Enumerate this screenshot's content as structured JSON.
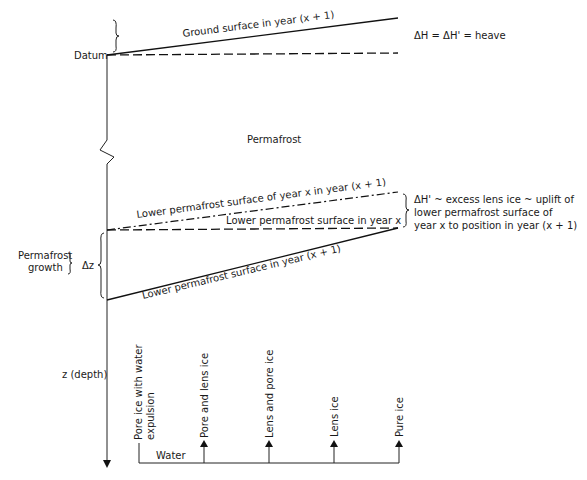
{
  "diagram": {
    "datum_label": "Datum",
    "ground_surface_label": "Ground surface in year (x + 1)",
    "heave_label": "ΔH = ΔH' = heave",
    "permafrost_label": "Permafrost",
    "lower_pf_x_in_x1_label": "Lower permafrost surface of year x in year (x + 1)",
    "lower_pf_x_label": "Lower permafrost surface in year x",
    "lower_pf_x1_label": "Lower permafrost surface in year (x + 1)",
    "excess_ice_lines": [
      "ΔH' ~ excess lens ice ~ uplift of",
      "lower permafrost surface of",
      "year x to position in year (x + 1)"
    ],
    "permafrost_growth_lines": [
      "Permafrost",
      "growth"
    ],
    "delta_z_label": "Δz",
    "depth_axis_label": "z (depth)",
    "water_label": "Water",
    "ice_types": [
      {
        "lines": [
          "Pore ice with water",
          "expulsion"
        ]
      },
      {
        "lines": [
          "Pore and lens ice"
        ]
      },
      {
        "lines": [
          "Lens and pore ice"
        ]
      },
      {
        "lines": [
          "Lens ice"
        ]
      },
      {
        "lines": [
          "Pure ice"
        ]
      }
    ]
  }
}
